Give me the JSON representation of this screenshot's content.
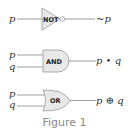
{
  "figure": {
    "caption": "Figure 1",
    "gates": [
      {
        "type": "NOT",
        "label": "NOT",
        "inputs": [
          "p"
        ],
        "output": "~p"
      },
      {
        "type": "AND",
        "label": "AND",
        "inputs": [
          "p",
          "q"
        ],
        "output": "p • q"
      },
      {
        "type": "OR",
        "label": "OR",
        "inputs": [
          "p",
          "q"
        ],
        "output": "p ⊕ q"
      }
    ],
    "colors": {
      "gate_fill": "#e8e8e8",
      "gate_stroke": "#999999",
      "wire": "#888888",
      "caption": "#8a8a8a"
    }
  }
}
